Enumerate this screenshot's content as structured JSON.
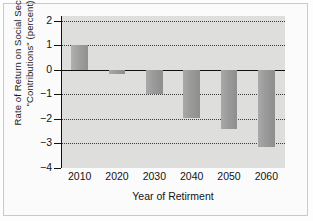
{
  "figure": {
    "background_color": "#fbfbfb",
    "plot_background_color": "#dededc",
    "bar_color": "#9a9a9a",
    "axis_color": "#111111"
  },
  "chart_data": {
    "type": "bar",
    "title": "",
    "xlabel": "Year of Retirment",
    "ylabel": "Rate of Return on Social Security \"Contributions\" (percent)",
    "ylabel_lines": [
      "Rate of Return on Social Security",
      "\"Contributions\" (percent)"
    ],
    "categories": [
      "2010",
      "2020",
      "2030",
      "2040",
      "2050",
      "2060"
    ],
    "values": [
      1.0,
      -0.15,
      -1.0,
      -1.95,
      -2.4,
      -3.15
    ],
    "ylim": [
      -4,
      2.2
    ],
    "yticks": [
      2,
      1,
      0,
      -1,
      -2,
      -3,
      -4
    ],
    "ytick_labels": [
      "2",
      "1",
      "0",
      "−1",
      "−2",
      "−3",
      "−4"
    ],
    "gridlines": [
      2,
      1,
      -1,
      -2,
      -3,
      -4
    ],
    "zero_line": 0,
    "grid": true,
    "grid_style": "dotted",
    "legend": "none",
    "series": [
      {
        "name": "Rate of Return",
        "values": [
          1.0,
          -0.15,
          -1.0,
          -1.95,
          -2.4,
          -3.15
        ]
      }
    ]
  }
}
